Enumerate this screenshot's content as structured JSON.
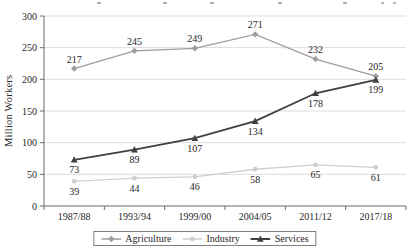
{
  "chart_data": {
    "type": "line",
    "categories": [
      "1987/88",
      "1993/94",
      "1999/00",
      "2004/05",
      "2011/12",
      "2017/18"
    ],
    "series": [
      {
        "name": "Agriculture",
        "values": [
          217,
          245,
          249,
          271,
          232,
          205
        ],
        "color": "#9e9e9e",
        "marker": "diamond",
        "label_position": "above",
        "line_width": 1.3
      },
      {
        "name": "Industry",
        "values": [
          39,
          44,
          46,
          58,
          65,
          61
        ],
        "color": "#cfcfcf",
        "marker": "circle",
        "label_position": "below",
        "line_width": 1.3
      },
      {
        "name": "Services",
        "values": [
          73,
          89,
          107,
          134,
          178,
          199
        ],
        "color": "#404040",
        "marker": "triangle",
        "label_position": "below",
        "line_width": 1.8
      }
    ],
    "xlabel": "",
    "ylabel": "Million Workers",
    "ylim": [
      0,
      300
    ],
    "ytick_step": 50,
    "yticks": [
      0,
      50,
      100,
      150,
      200,
      250,
      300
    ],
    "grid": true,
    "legend_position": "bottom",
    "data_labels_shown": true
  },
  "styles": {
    "grid_color": "#dcdcdc",
    "axis_color": "#6b6b6b",
    "tick_label_color": "#262626",
    "data_label_color": "#1a1a1a",
    "legend_border_color": "#808080",
    "background": "#ffffff"
  }
}
